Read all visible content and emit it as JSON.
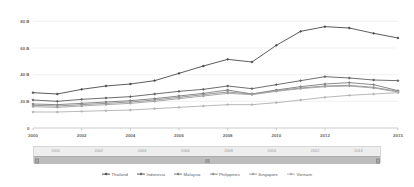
{
  "chart_data": {
    "type": "line",
    "title": "",
    "xlabel": "",
    "ylabel": "",
    "grid": true,
    "legend_position": "bottom",
    "x": [
      2000,
      2001,
      2002,
      2003,
      2004,
      2005,
      2006,
      2007,
      2008,
      2009,
      2010,
      2011,
      2012,
      2013,
      2014,
      2015
    ],
    "xlim": [
      2000,
      2015
    ],
    "ylim": [
      0,
      90
    ],
    "x_tick_labels": [
      "2000",
      "2002",
      "2004",
      "2006",
      "2008",
      "2010",
      "2012",
      "2015"
    ],
    "x_tick_values": [
      2000,
      2002,
      2004,
      2006,
      2008,
      2010,
      2012,
      2015
    ],
    "y_tick_labels": [
      "0",
      "20 B",
      "40 B",
      "60 B",
      "80 B"
    ],
    "y_tick_values": [
      0,
      20,
      40,
      60,
      80
    ],
    "series": [
      {
        "name": "Thailand",
        "color": "#4a4a4a",
        "values": [
          26.5,
          25.5,
          29.0,
          31.5,
          33.0,
          35.5,
          41.0,
          46.5,
          51.5,
          49.5,
          62.0,
          72.5,
          76.0,
          75.0,
          71.0,
          67.5
        ]
      },
      {
        "name": "Indonesia",
        "color": "#5f5f5f",
        "values": [
          21.0,
          20.0,
          21.5,
          22.5,
          23.5,
          25.5,
          27.5,
          29.0,
          31.5,
          29.5,
          32.5,
          35.5,
          38.5,
          37.5,
          36.0,
          35.5
        ]
      },
      {
        "name": "Malaysia",
        "color": "#7d7d7d",
        "values": [
          18.0,
          17.5,
          18.5,
          19.5,
          20.5,
          22.0,
          24.0,
          26.0,
          28.5,
          25.5,
          28.5,
          31.0,
          33.0,
          34.0,
          32.5,
          28.0
        ]
      },
      {
        "name": "Philippines",
        "color": "#8f8f8f",
        "values": [
          17.0,
          16.5,
          17.5,
          18.5,
          19.5,
          21.0,
          23.0,
          25.0,
          27.0,
          25.5,
          28.0,
          30.0,
          31.5,
          32.0,
          30.5,
          27.5
        ]
      },
      {
        "name": "Singapore",
        "color": "#a0a0a0",
        "values": [
          16.0,
          15.5,
          16.5,
          17.5,
          18.5,
          20.0,
          22.0,
          24.0,
          26.0,
          25.0,
          27.5,
          29.5,
          31.0,
          31.5,
          30.0,
          27.0
        ]
      },
      {
        "name": "Vietnam",
        "color": "#b0b0b0",
        "values": [
          12.0,
          12.0,
          12.5,
          13.0,
          13.5,
          14.5,
          15.5,
          16.5,
          17.5,
          17.5,
          19.0,
          21.0,
          23.0,
          24.5,
          25.5,
          26.5
        ]
      }
    ]
  },
  "range_slider": {
    "years": [
      "2000",
      "2002",
      "2004",
      "2006",
      "2008",
      "2010",
      "2012",
      "2014"
    ],
    "track_color": "#bdbdbd"
  }
}
